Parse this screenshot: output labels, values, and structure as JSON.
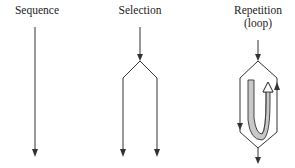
{
  "diagram": {
    "panels": [
      {
        "id": "sequence",
        "label": "Sequence"
      },
      {
        "id": "selection",
        "label": "Selection"
      },
      {
        "id": "repetition",
        "label_line1": "Repetition",
        "label_line2": "(loop)"
      }
    ],
    "colors": {
      "line": "#333333",
      "loop_fill": "#c8c8c8",
      "background": "#ffffff"
    }
  }
}
